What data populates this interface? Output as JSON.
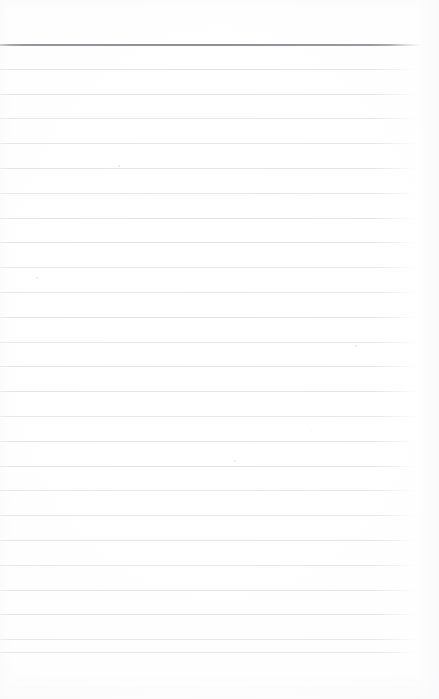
{
  "document": {
    "kind": "scanned-ruled-notepad-page",
    "title": "Blank Ruled Notepad Page",
    "body_text": "",
    "has_handwriting": false,
    "has_printed_text": false,
    "orientation": "portrait",
    "page_width": 439,
    "page_height": 699
  },
  "colors": {
    "paper": "#ffffff",
    "paper_tint": "#fcfcfd",
    "rule_line": "#e3e3e7",
    "header_rule": "#8e8e95",
    "speck": "#d8d8dd"
  },
  "layout": {
    "top_margin": 44,
    "bottom_margin": 47,
    "left_margin": 0,
    "right_margin": 19,
    "line_spacing": 24.8,
    "rule_start_x": 0,
    "rule_end_x": 420,
    "line_count": 26
  },
  "rules": [
    {
      "y": 44,
      "weight": "header"
    },
    {
      "y": 68.8,
      "weight": "light"
    },
    {
      "y": 93.6,
      "weight": "light"
    },
    {
      "y": 118.4,
      "weight": "light"
    },
    {
      "y": 143.2,
      "weight": "light"
    },
    {
      "y": 168.0,
      "weight": "light"
    },
    {
      "y": 192.8,
      "weight": "light"
    },
    {
      "y": 217.6,
      "weight": "light"
    },
    {
      "y": 242.4,
      "weight": "light"
    },
    {
      "y": 267.2,
      "weight": "light"
    },
    {
      "y": 292.0,
      "weight": "light"
    },
    {
      "y": 316.8,
      "weight": "light"
    },
    {
      "y": 341.6,
      "weight": "light"
    },
    {
      "y": 366.4,
      "weight": "light"
    },
    {
      "y": 391.2,
      "weight": "light"
    },
    {
      "y": 416.0,
      "weight": "light"
    },
    {
      "y": 440.8,
      "weight": "light"
    },
    {
      "y": 465.6,
      "weight": "light"
    },
    {
      "y": 490.4,
      "weight": "light"
    },
    {
      "y": 515.2,
      "weight": "light"
    },
    {
      "y": 540.0,
      "weight": "light"
    },
    {
      "y": 564.8,
      "weight": "light"
    },
    {
      "y": 589.6,
      "weight": "light"
    },
    {
      "y": 614.4,
      "weight": "light"
    },
    {
      "y": 639.2,
      "weight": "light"
    },
    {
      "y": 652.0,
      "weight": "light"
    }
  ],
  "specks": [
    {
      "x": 118,
      "y": 165,
      "size": 2
    },
    {
      "x": 36,
      "y": 277,
      "size": 2
    },
    {
      "x": 355,
      "y": 345,
      "size": 2
    },
    {
      "x": 234,
      "y": 460,
      "size": 2
    },
    {
      "x": 311,
      "y": 430,
      "size": 1
    }
  ]
}
